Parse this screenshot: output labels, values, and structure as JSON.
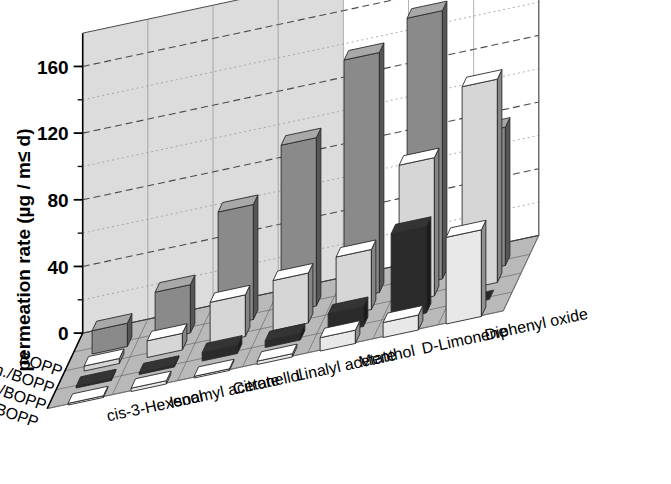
{
  "figure": {
    "background_color": "#ffffff",
    "axis_title_y": "permeation rate (µg / m≤ d)",
    "y_ticks": [
      "0",
      "40",
      "80",
      "120",
      "160"
    ],
    "y_minor_step": 20
  },
  "chart_data": {
    "type": "bar",
    "title": "",
    "subtitle": "",
    "xlabel": "",
    "ylabel": "permeation rate (µg / m² d)",
    "zlabel": "",
    "ylim": [
      0,
      180
    ],
    "yticks": [
      0,
      40,
      80,
      120,
      160
    ],
    "grid": true,
    "legend_position": "none",
    "projection": "3d-bar",
    "categories": [
      "cis-3-Hexenol",
      "Isoamyl acetate",
      "Citronellol",
      "Linalyl acetate",
      "Menthol",
      "D-Limonene",
      "Diphenyl oxide"
    ],
    "series": [
      {
        "name": "BOPP",
        "color": "#8a8a8a",
        "values": [
          14,
          29,
          69,
          101,
          144,
          161,
          83
        ]
      },
      {
        "name": "BOPP/Adh./BOPP",
        "color": "#d6d6d6",
        "values": [
          3,
          10,
          25,
          30,
          36,
          83,
          122
        ]
      },
      {
        "name": "BOPP-Al/Adh./BOPP",
        "color": "#2b2b2b",
        "values": [
          1,
          1,
          5,
          4,
          12,
          52,
          0
        ]
      },
      {
        "name": "BOPP SOₓ/Adh./BOPP",
        "color": "#e8e8e8",
        "values": [
          1,
          2,
          1,
          2,
          8,
          9,
          52
        ]
      }
    ],
    "series_labels_display": [
      "BOPP",
      "BOPP/Adh./BOPP",
      "BOPP-Al/Adh./BOPP",
      "BOPP SOx/Adh./BOPP"
    ]
  },
  "colors": {
    "back_wall_shaded": "#dcdcdc",
    "back_wall_light": "#ffffff",
    "floor": "#b9b9b9",
    "gridline": "#6f6f6f",
    "axis_line": "#000000",
    "bar_top_tint": "#ffffff",
    "bar_side_tint": "#000000"
  }
}
